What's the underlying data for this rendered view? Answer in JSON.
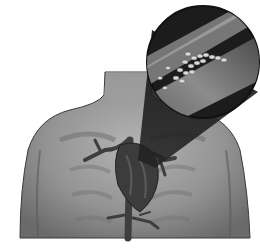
{
  "image": {
    "subject": "Medical illustration: human torso with heart and magnified view of artery with plaque buildup",
    "style": "grayscale",
    "elements": [
      "torso",
      "neck",
      "heart",
      "blood-vessels",
      "magnifier-circle",
      "artery-with-plaque"
    ]
  },
  "colors": {
    "background": "#ffffff",
    "skin_light": "#a9a9a9",
    "skin_mid": "#8a8a8a",
    "skin_dark": "#5e5e5e",
    "outline": "#3a3a3a",
    "heart": "#3c3c3c",
    "magnifier": "#1e1e1e",
    "plaque": "#d9d9d9"
  }
}
